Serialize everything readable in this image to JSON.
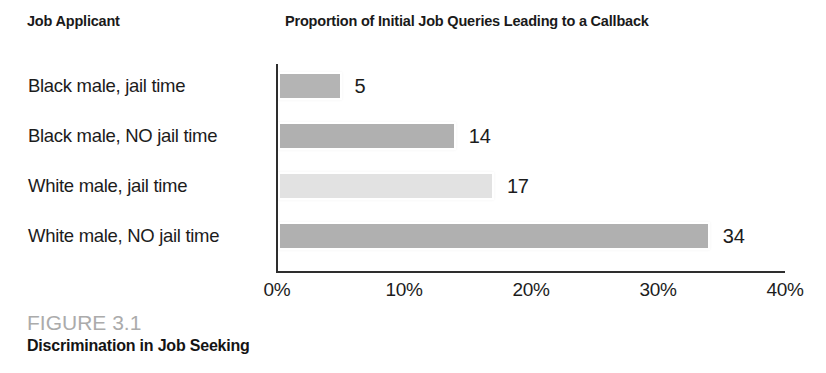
{
  "headers": {
    "applicant": "Job Applicant",
    "proportion": "Proportion of Initial Job Queries Leading to a Callback"
  },
  "caption": {
    "figure_number": "FIGURE 3.1",
    "title": "Discrimination in Job Seeking"
  },
  "chart_data": {
    "type": "bar",
    "orientation": "horizontal",
    "title": "Proportion of Initial Job Queries Leading to a Callback",
    "xlabel": "",
    "ylabel": "Job Applicant",
    "xlim": [
      0,
      40
    ],
    "grid": false,
    "legend": "none",
    "categories": [
      "Black male, jail time",
      "Black male, NO jail time",
      "White male, jail time",
      "White male, NO jail time"
    ],
    "values": [
      5,
      14,
      17,
      34
    ],
    "value_labels": [
      "5",
      "14",
      "17",
      "34"
    ],
    "unit": "%",
    "bar_colors": [
      "#b4b4b4",
      "#b0b0b0",
      "#e2e2e2",
      "#b0b0b0"
    ],
    "tick_labels": [
      "0%",
      "10%",
      "20%",
      "30%",
      "40%"
    ],
    "tick_values": [
      0,
      10,
      20,
      30,
      40
    ]
  }
}
